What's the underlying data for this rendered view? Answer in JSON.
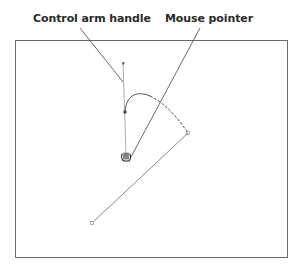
{
  "labels": {
    "control_arm_handle": "Control arm handle",
    "mouse_pointer": "Mouse pointer"
  },
  "colors": {
    "stroke": "#555555",
    "frame": "#666666",
    "text": "#2a2a2a"
  },
  "canvas": {
    "cursor_icon": "hand-grab-icon"
  }
}
